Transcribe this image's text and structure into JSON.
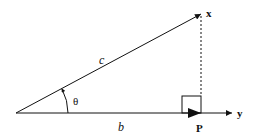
{
  "diagram": {
    "labels": {
      "hypotenuse": "c",
      "adjacent": "b",
      "angle": "θ",
      "vector_x": "x",
      "vector_y": "y",
      "projection_point": "P"
    },
    "elements": {
      "vector_x": "arrow from origin to x",
      "vector_y": "arrow along base to y",
      "projection": "dashed perpendicular from x to P",
      "right_angle": "square marker at P",
      "angle_arc": "arc with arrow indicating θ"
    },
    "colors": {
      "stroke": "#111111",
      "background": "#ffffff"
    }
  }
}
